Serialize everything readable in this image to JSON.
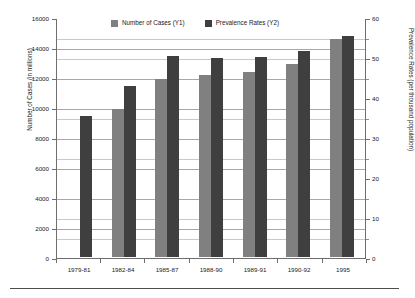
{
  "chart_data": {
    "type": "bar",
    "title": "",
    "subtitle": "",
    "categories": [
      "1979-81",
      "1982-84",
      "1985-87",
      "1988-90",
      "1989-91",
      "1990-92",
      "1995"
    ],
    "series": [
      {
        "name": "Number of Cases (Y1)",
        "axis": "y1",
        "color": "#808080",
        "values": [
          null,
          9850,
          11900,
          12150,
          12350,
          12850,
          14550
        ]
      },
      {
        "name": "Prevalence Rates (Y2)",
        "axis": "y2",
        "color": "#3f3f3f",
        "values": [
          35.3,
          42.8,
          50.3,
          49.8,
          50.1,
          51.6,
          55.3
        ]
      }
    ],
    "xlabel": "",
    "ylabel": "Number of Cases (in millions)",
    "y2label": "Prevalence Rates (per thousand population)",
    "ylim": [
      0,
      16000
    ],
    "y2lim": [
      0,
      60
    ],
    "yticks": [
      0,
      2000,
      4000,
      6000,
      8000,
      10000,
      12000,
      14000,
      16000
    ],
    "y2ticks": [
      0,
      10,
      20,
      30,
      40,
      50,
      60
    ],
    "y2minorticks": [
      5,
      15,
      25,
      35,
      45,
      55
    ],
    "grid": true,
    "legend_position": "top-center"
  },
  "axes": {
    "left": {
      "title": "Number of Cases (in millions)",
      "ticklabels": [
        "16000",
        "14000",
        "12000",
        "10000",
        "8000",
        "6000",
        "4000",
        "2000",
        "0"
      ]
    },
    "right": {
      "title": "Prevalence Rates (per thousand population)",
      "ticklabels": [
        "60",
        "50",
        "40",
        "30",
        "20",
        "10",
        "0"
      ]
    },
    "bottom": {
      "ticklabels": [
        "1979-81",
        "1982-84",
        "1985-87",
        "1988-90",
        "1989-91",
        "1990-92",
        "1995"
      ]
    }
  },
  "legend": {
    "entries": [
      {
        "label": "Number of Cases (Y1)",
        "color": "#808080",
        "swatch": "cases"
      },
      {
        "label": "Prevalence Rates (Y2)",
        "color": "#3f3f3f",
        "swatch": "prev"
      }
    ]
  }
}
